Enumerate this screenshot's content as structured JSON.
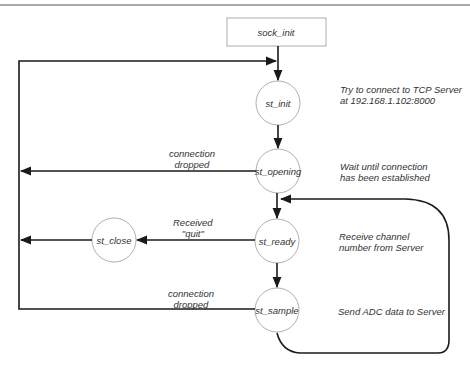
{
  "diagram": {
    "type": "state-machine",
    "colors": {
      "stroke": "#1a1a1a",
      "node_border": "#9a9a9a",
      "text": "#333333",
      "top_rule": "#555555"
    },
    "nodes": [
      {
        "id": "sock_init",
        "label": "sock_init",
        "shape": "rect",
        "x": 227,
        "y": 18,
        "w": 99,
        "h": 28
      },
      {
        "id": "st_init",
        "label": "st_init",
        "shape": "circle",
        "cx": 278,
        "cy": 103,
        "r": 22
      },
      {
        "id": "st_opening",
        "label": "st_opening",
        "shape": "circle",
        "cx": 278,
        "cy": 171,
        "r": 22
      },
      {
        "id": "st_ready",
        "label": "st_ready",
        "shape": "circle",
        "cx": 277,
        "cy": 241,
        "r": 22
      },
      {
        "id": "st_close",
        "label": "st_close",
        "shape": "circle",
        "cx": 114,
        "cy": 240,
        "r": 22
      },
      {
        "id": "st_sample",
        "label": "st_sample",
        "shape": "circle",
        "cx": 277,
        "cy": 310,
        "r": 22
      }
    ],
    "edge_labels": {
      "opening_dropped": "connection\ndropped",
      "ready_quit": "Received\n\"quit\"",
      "sample_dropped": "connection\ndropped"
    },
    "annotations": {
      "st_init": "Try to connect to TCP Server\nat 192.168.1.102:8000",
      "st_opening": "Wait until connection\nhas been established",
      "st_ready": "Receive channel\nnumber from Server",
      "st_sample": "Send ADC data to Server"
    },
    "edges": [
      {
        "from": "sock_init",
        "to": "st_init"
      },
      {
        "from": "st_init",
        "to": "st_opening"
      },
      {
        "from": "st_opening",
        "to": "st_ready"
      },
      {
        "from": "st_ready",
        "to": "st_sample"
      },
      {
        "from": "st_opening",
        "to": "left_bus",
        "label": "connection dropped"
      },
      {
        "from": "st_ready",
        "to": "st_close",
        "label": "Received \"quit\""
      },
      {
        "from": "st_close",
        "to": "left_bus"
      },
      {
        "from": "st_sample",
        "to": "left_bus",
        "label": "connection dropped"
      },
      {
        "from": "left_bus",
        "to": "st_init"
      },
      {
        "from": "st_sample",
        "to": "st_ready",
        "label": "loop"
      }
    ]
  }
}
